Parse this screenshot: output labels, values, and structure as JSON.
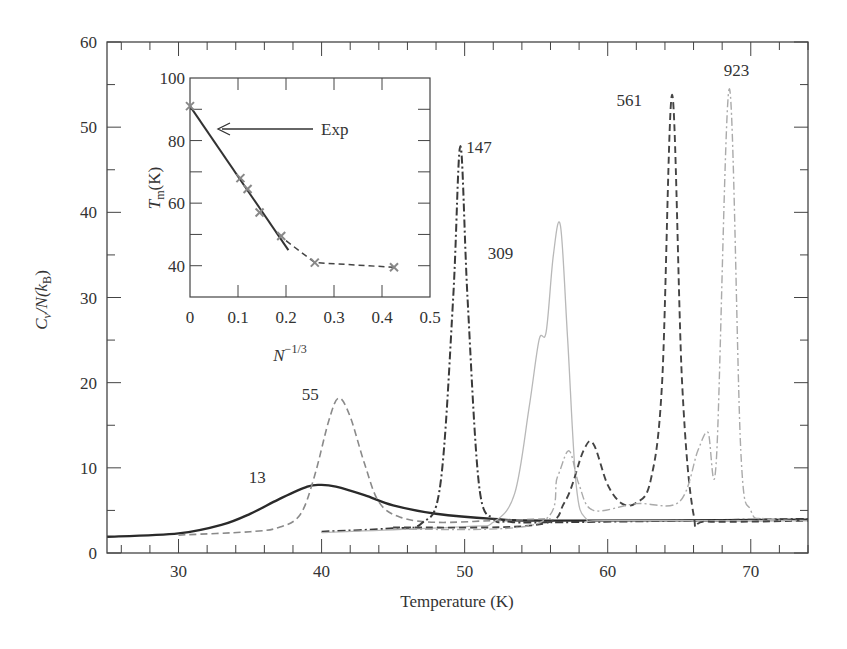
{
  "chart_data": [
    {
      "type": "line",
      "title": "",
      "xlabel": "Temperature (K)",
      "ylabel": "Cv/N(kB)",
      "xlim": [
        25,
        74
      ],
      "ylim": [
        0,
        60
      ],
      "xticks": [
        30,
        40,
        50,
        60,
        70
      ],
      "yticks": [
        0,
        10,
        20,
        30,
        40,
        50,
        60
      ],
      "grid": false,
      "legend": "none; curves labeled inline by cluster size",
      "series": [
        {
          "name": "13",
          "style": "solid",
          "color": "#2a2a2a",
          "x": [
            25,
            30,
            33,
            35,
            37,
            39,
            40,
            41,
            43,
            45,
            48,
            52,
            56,
            74
          ],
          "y": [
            1.9,
            2.3,
            3.3,
            4.6,
            6.3,
            7.8,
            8.0,
            7.8,
            6.8,
            5.6,
            4.6,
            4.0,
            3.8,
            3.9
          ]
        },
        {
          "name": "55",
          "style": "dashed",
          "color": "#8a8a8a",
          "x": [
            30,
            35,
            37,
            38.5,
            39.5,
            40.5,
            41.2,
            42,
            43,
            44,
            45.5,
            48,
            52,
            56
          ],
          "y": [
            2.1,
            2.5,
            3.0,
            4.5,
            9.0,
            15.5,
            18.2,
            16.0,
            10.5,
            6.0,
            4.2,
            3.6,
            3.8,
            4.0
          ]
        },
        {
          "name": "147",
          "style": "dash-dot",
          "color": "#3a3a3a",
          "x": [
            40,
            45,
            47,
            48.3,
            49.2,
            49.7,
            50.2,
            51,
            52,
            53,
            56,
            74
          ],
          "y": [
            2.5,
            2.9,
            3.5,
            8.0,
            30.0,
            47.8,
            30.0,
            8.0,
            4.0,
            3.7,
            3.6,
            4.0
          ]
        },
        {
          "name": "309",
          "style": "solid-light",
          "color": "#b8b8b8",
          "x": [
            40,
            50,
            52,
            53.5,
            54.5,
            55.2,
            55.7,
            56.2,
            56.7,
            57.2,
            57.8,
            58.5,
            60,
            74
          ],
          "y": [
            2.4,
            3.1,
            3.6,
            7.0,
            17.0,
            25.0,
            26.0,
            35.0,
            38.4,
            25.0,
            8.0,
            4.0,
            3.8,
            3.8
          ]
        },
        {
          "name": "561",
          "style": "dashed-dark",
          "color": "#444444",
          "x": [
            45,
            55,
            57,
            58.3,
            59,
            60,
            61,
            62,
            63,
            63.8,
            64.5,
            65.2,
            66,
            67,
            74
          ],
          "y": [
            3.0,
            3.3,
            6.0,
            12.0,
            12.8,
            8.0,
            5.8,
            5.9,
            8.5,
            20.0,
            53.8,
            20.0,
            4.5,
            3.7,
            3.8
          ]
        },
        {
          "name": "923",
          "style": "dash-dot-light",
          "color": "#aaaaaa",
          "x": [
            45,
            55,
            56.5,
            57.3,
            58,
            59,
            62,
            65,
            66.3,
            67,
            67.6,
            68.5,
            69.3,
            70,
            71,
            74
          ],
          "y": [
            2.8,
            3.4,
            9.0,
            12.0,
            8.0,
            5.0,
            5.8,
            6.0,
            12.0,
            14.2,
            11.0,
            54.5,
            12.0,
            5.0,
            4.0,
            3.8
          ]
        }
      ],
      "annotations": [
        {
          "text": "13",
          "x": 35.5,
          "y": 8.2
        },
        {
          "text": "55",
          "x": 39.2,
          "y": 18.0
        },
        {
          "text": "147",
          "x": 51.0,
          "y": 47.0
        },
        {
          "text": "309",
          "x": 52.5,
          "y": 34.5
        },
        {
          "text": "561",
          "x": 61.5,
          "y": 52.5
        },
        {
          "text": "923",
          "x": 69.0,
          "y": 56.0
        }
      ]
    },
    {
      "type": "line",
      "title": "",
      "inset": true,
      "xlabel": "N^-1/3",
      "ylabel": "Tm(K)",
      "xlim": [
        0,
        0.5
      ],
      "ylim": [
        30,
        100
      ],
      "xticks": [
        0,
        0.1,
        0.2,
        0.3,
        0.4,
        0.5
      ],
      "yticks": [
        40,
        60,
        80,
        100
      ],
      "series": [
        {
          "name": "points",
          "style": "x-markers",
          "color": "#888888",
          "x": [
            0.0,
            0.105,
            0.12,
            0.145,
            0.19,
            0.26,
            0.425
          ],
          "y": [
            91,
            68,
            64.5,
            57,
            49.5,
            41,
            39.5
          ]
        },
        {
          "name": "linear fit",
          "style": "solid",
          "color": "#333333",
          "x": [
            0.0,
            0.205
          ],
          "y": [
            91,
            45
          ]
        },
        {
          "name": "trend",
          "style": "dashed",
          "color": "#444444",
          "x": [
            0.2,
            0.26,
            0.425
          ],
          "y": [
            48,
            41,
            39.5
          ]
        }
      ],
      "annotations": [
        {
          "text": "Exp",
          "arrow_to": {
            "x": 0.05,
            "y": 84
          }
        }
      ]
    }
  ],
  "labels": {
    "main_xlabel": "Temperature (K)",
    "main_ylabel_C": "C",
    "main_ylabel_v": "v",
    "main_ylabel_rest": "/N(k",
    "main_ylabel_B": "B",
    "main_ylabel_close": ")",
    "inset_ylabel_T": "T",
    "inset_ylabel_m": "m",
    "inset_ylabel_rest": "(K)",
    "inset_xlabel_N": "N",
    "inset_xlabel_exp": "−1/3",
    "exp_label": "Exp"
  }
}
